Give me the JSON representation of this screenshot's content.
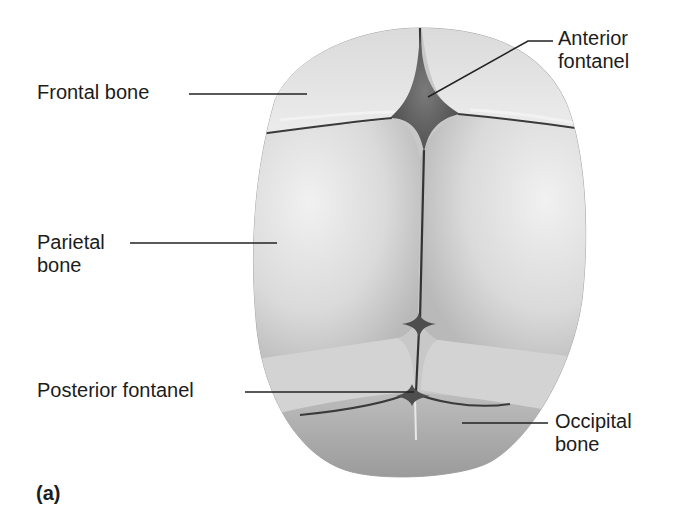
{
  "figure": {
    "panel_label": "(a)"
  },
  "labels": {
    "frontal_bone": "Frontal bone",
    "anterior_fontanel_line1": "Anterior",
    "anterior_fontanel_line2": "fontanel",
    "parietal_bone_line1": "Parietal",
    "parietal_bone_line2": "bone",
    "posterior_fontanel": "Posterior fontanel",
    "occipital_bone_line1": "Occipital",
    "occipital_bone_line2": "bone"
  },
  "colors": {
    "background": "#ffffff",
    "bone_light": "#e4e4e4",
    "bone_mid": "#c9c9c9",
    "bone_edge": "#9a9a9a",
    "suture": "#3a3a3a",
    "fontanel": "#6a6a6a",
    "leader_line": "#222222",
    "text": "#1c1c1c"
  }
}
